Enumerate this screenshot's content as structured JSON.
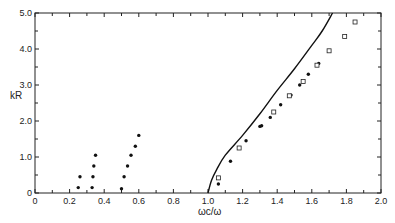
{
  "chart_data": {
    "type": "scatter",
    "title": "",
    "xlabel": "ωc/ω",
    "ylabel": "kR",
    "xlim": [
      0,
      2.0
    ],
    "ylim": [
      0,
      5.0
    ],
    "grid": false,
    "legend": null,
    "x_ticks": [
      "0",
      "0.2",
      "0.4",
      "0.6",
      "0.8",
      "1.0",
      "1.2",
      "1.4",
      "1.6",
      "1.8",
      "2.0"
    ],
    "y_ticks": [
      "0",
      "1.0",
      "2.0",
      "3.0",
      "4.0",
      "5.0"
    ],
    "series": [
      {
        "name": "filled dots (low branch)",
        "marker": "filled-circle",
        "points": [
          [
            0.25,
            0.15
          ],
          [
            0.26,
            0.45
          ],
          [
            0.33,
            0.15
          ],
          [
            0.335,
            0.45
          ],
          [
            0.34,
            0.75
          ],
          [
            0.35,
            1.05
          ],
          [
            0.5,
            0.12
          ],
          [
            0.515,
            0.45
          ],
          [
            0.535,
            0.75
          ],
          [
            0.555,
            1.05
          ],
          [
            0.58,
            1.3
          ],
          [
            0.6,
            1.6
          ]
        ]
      },
      {
        "name": "filled dots (high branch)",
        "marker": "filled-circle",
        "points": [
          [
            1.06,
            0.25
          ],
          [
            1.13,
            0.88
          ],
          [
            1.22,
            1.45
          ],
          [
            1.3,
            1.85
          ],
          [
            1.31,
            1.87
          ],
          [
            1.36,
            2.1
          ],
          [
            1.42,
            2.45
          ],
          [
            1.48,
            2.72
          ],
          [
            1.53,
            3.0
          ],
          [
            1.58,
            3.3
          ],
          [
            1.64,
            3.6
          ]
        ]
      },
      {
        "name": "open squares",
        "marker": "open-square",
        "points": [
          [
            1.06,
            0.42
          ],
          [
            1.18,
            1.25
          ],
          [
            1.38,
            2.25
          ],
          [
            1.47,
            2.7
          ],
          [
            1.55,
            3.1
          ],
          [
            1.63,
            3.55
          ],
          [
            1.7,
            3.95
          ],
          [
            1.79,
            4.35
          ],
          [
            1.85,
            4.75
          ]
        ]
      },
      {
        "name": "theory curve",
        "type": "line",
        "points": [
          [
            1.0,
            0.0
          ],
          [
            1.02,
            0.35
          ],
          [
            1.05,
            0.65
          ],
          [
            1.1,
            1.05
          ],
          [
            1.2,
            1.6
          ],
          [
            1.3,
            2.2
          ],
          [
            1.4,
            2.85
          ],
          [
            1.5,
            3.45
          ],
          [
            1.6,
            4.1
          ],
          [
            1.66,
            4.5
          ],
          [
            1.72,
            5.0
          ]
        ]
      }
    ]
  }
}
